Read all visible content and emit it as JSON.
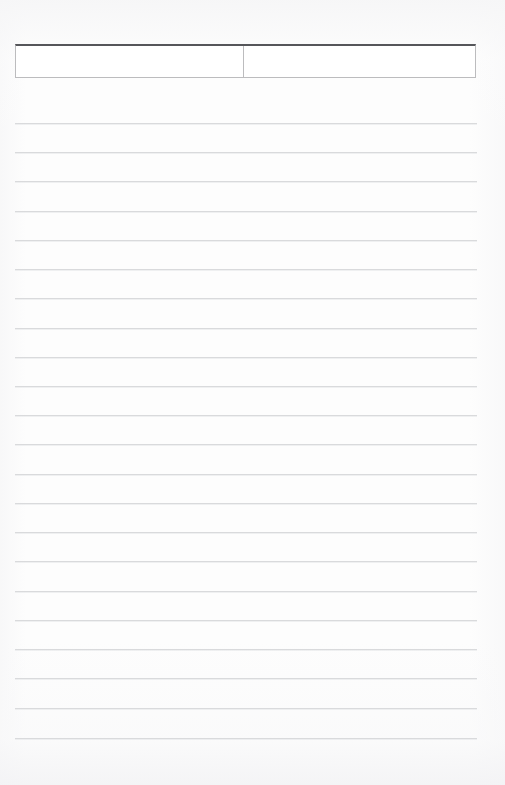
{
  "document": {
    "kind": "blank-ruled-form",
    "page_width": 505,
    "page_height": 785,
    "background_color": "#fdfdfd",
    "has_visible_text": false
  },
  "header_table": {
    "name": "two-cell-header-box",
    "x": 15,
    "y": 44,
    "width": 461,
    "height": 34,
    "divider_x": 243,
    "top_border_color": "#55565a",
    "border_color": "#bcbcbe",
    "cells": [
      {
        "id": "left",
        "label": "",
        "value": "",
        "width": 228
      },
      {
        "id": "right",
        "label": "",
        "value": "",
        "width": 232
      }
    ]
  },
  "ruled_lines": {
    "name": "writing-rules",
    "color": "#d9dadc",
    "left_x": 15,
    "right_x": 477,
    "first_y": 123,
    "spacing": 29.2,
    "count": 22,
    "y_positions": [
      123,
      152,
      181,
      211,
      240,
      269,
      298,
      328,
      357,
      386,
      415,
      444,
      474,
      503,
      532,
      561,
      591,
      620,
      649,
      678,
      708,
      738
    ]
  }
}
